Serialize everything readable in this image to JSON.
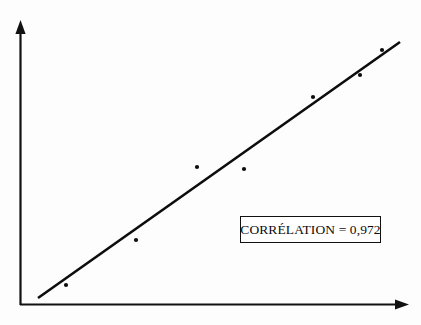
{
  "figure": {
    "background_color": "#fdfdfd",
    "ink_color": "#111111",
    "width": 421,
    "height": 325
  },
  "annotation": {
    "correlation_text": "CORRÉLATION = 0,972",
    "box_border_color": "#111111",
    "box_fill_color": "#ffffff"
  },
  "axes": {
    "x_axis_name": "x-axis",
    "y_axis_name": "y-axis",
    "origin_px": [
      20,
      305
    ],
    "x_axis_end_px": [
      408,
      305
    ],
    "y_axis_end_px": [
      20,
      22
    ],
    "arrowheads": true,
    "tick_labels_x": [],
    "tick_labels_y": [],
    "grid": false
  },
  "chart_data": {
    "type": "scatter",
    "title": "",
    "subtitle": "",
    "xlabel": "",
    "ylabel": "",
    "xlim": [
      0,
      100
    ],
    "ylim": [
      0,
      100
    ],
    "grid": false,
    "legend": null,
    "annotations": [
      {
        "name": "correlation-box",
        "text": "CORRÉLATION = 0,972",
        "value": 0.972,
        "decimal_separator": ",",
        "boxed": true,
        "x_px": 240,
        "y_px": 216,
        "width_px": 141,
        "height_px": 27
      }
    ],
    "series": [
      {
        "name": "observations",
        "type": "scatter",
        "marker": "circle",
        "marker_size_px": 4.2,
        "color": "#0d0d0d",
        "points_px": [
          [
            66,
            285
          ],
          [
            136,
            240
          ],
          [
            197,
            167
          ],
          [
            244,
            169
          ],
          [
            313,
            97
          ],
          [
            360,
            75
          ],
          [
            382,
            50
          ]
        ],
        "x": [
          11.9,
          29.9,
          45.6,
          57.7,
          75.5,
          87.6,
          93.3
        ],
        "y": [
          7.1,
          23.0,
          48.8,
          48.1,
          73.5,
          81.3,
          90.1
        ]
      },
      {
        "name": "regression-line",
        "type": "line",
        "color": "#0d0d0d",
        "line_width_px": 2.6,
        "start_px": [
          38,
          298
        ],
        "end_px": [
          400,
          42
        ],
        "x": [
          4.6,
          97.9
        ],
        "y": [
          2.5,
          93.0
        ]
      }
    ]
  }
}
